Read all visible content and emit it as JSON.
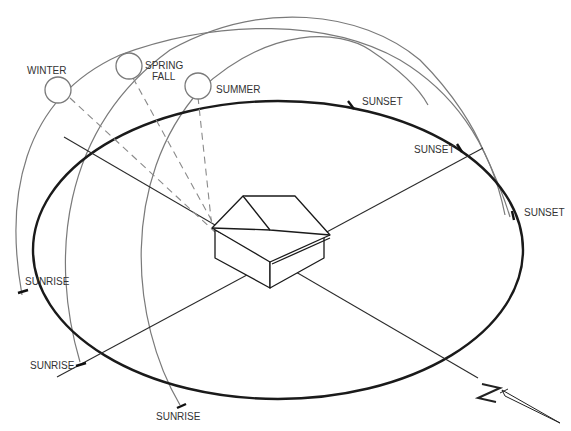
{
  "diagram": {
    "sun_positions": [
      {
        "id": "winter",
        "label": "WINTER"
      },
      {
        "id": "spring-fall",
        "label_line1": "SPRING",
        "label_line2": "FALL"
      },
      {
        "id": "summer",
        "label": "SUMMER"
      }
    ],
    "sunset_labels": [
      "SUNSET",
      "SUNSET",
      "SUNSET"
    ],
    "sunrise_labels": [
      "SUNRISE",
      "SUNRISE",
      "SUNRISE"
    ],
    "compass": {
      "label": "N"
    },
    "colors": {
      "orbit": "#1a1a1a",
      "arc": "#7a7a7a",
      "ray": "#8a8a8a",
      "background": "#ffffff"
    }
  }
}
